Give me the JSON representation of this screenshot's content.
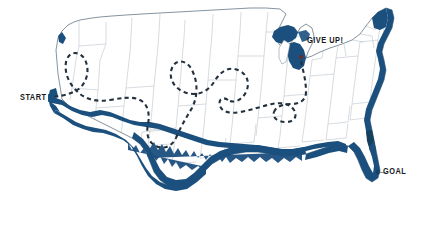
{
  "figure": {
    "type": "annotated-map",
    "background_color": "#ffffff"
  },
  "labels": {
    "start": "START",
    "give_up": "GIVE UP!",
    "goal": "GOAL"
  },
  "colors": {
    "coast_band": "#1b4f7e",
    "coast_band_dark": "#14405f",
    "state_border": "#b9c2c9",
    "outline": "#7d8a96",
    "route_dashed": "#22313d",
    "route_solid": "#1b4f7e",
    "give_up_marker": "#6b2b20",
    "label_text": "#16191c",
    "land_fill": "#ffffff"
  },
  "markers": {
    "start_point": {
      "x": 52,
      "y": 97,
      "label": "START"
    },
    "give_up_point": {
      "x": 306,
      "y": 58,
      "label": "GIVE UP!"
    },
    "goal_point": {
      "x": 378,
      "y": 172,
      "label": "GOAL"
    }
  },
  "routes": [
    {
      "name": "wandering-route",
      "style": "dashed",
      "color": "#22313d",
      "from": "START",
      "to": "GIVE UP!",
      "description": "meandering dashed path looping through the western and central states, ending near Lake Michigan"
    },
    {
      "name": "coastal-route",
      "style": "solid",
      "color": "#1b4f7e",
      "from": "START",
      "to": "GOAL",
      "description": "thick solid band following the southern border and Gulf coast to southern Florida"
    }
  ]
}
